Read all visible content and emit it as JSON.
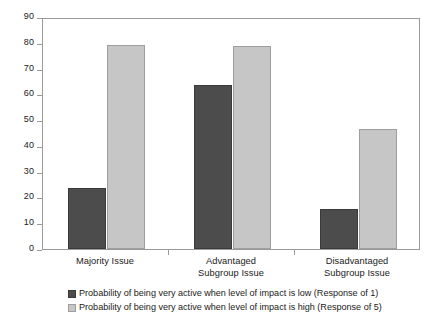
{
  "chart_data": {
    "type": "bar",
    "title": "",
    "subtitle": "",
    "xlabel": "",
    "ylabel": "",
    "ylim": [
      0,
      90
    ],
    "ytick_step": 10,
    "yticks": [
      "0",
      "10",
      "20",
      "30",
      "40",
      "50",
      "60",
      "70",
      "80",
      "90"
    ],
    "grid": false,
    "legend_position": "bottom",
    "categories": [
      "Majority Issue",
      "Advantaged\nSubgroup Issue",
      "Disadvantaged\nSubgroup Issue"
    ],
    "series": [
      {
        "name": "Probability of being very active when level of impact is low (Response of 1)",
        "key": "low",
        "color": "#4c4c4c",
        "values": [
          23.5,
          63.5,
          15.5
        ]
      },
      {
        "name": "Probability of being very active when level of impact is high (Response of 5)",
        "key": "high",
        "color": "#c6c6c6",
        "values": [
          79.0,
          78.8,
          46.5
        ]
      }
    ]
  },
  "legend": {
    "items": [
      {
        "swatch": "dark-gray-square",
        "label": "Probability of being very active when level of impact is low (Response of 1)"
      },
      {
        "swatch": "light-gray-square",
        "label": "Probability of being very active when level of impact is high (Response of 5)"
      }
    ]
  },
  "axis": {
    "y_tick_labels": [
      "90",
      "80",
      "70",
      "60",
      "50",
      "40",
      "30",
      "20",
      "10",
      "0"
    ],
    "x_tick_labels": [
      "Majority Issue",
      "Advantaged\nSubgroup Issue",
      "Disadvantaged\nSubgroup Issue"
    ]
  },
  "colors": {
    "series_low": "#4c4c4c",
    "series_high": "#c6c6c6",
    "frame": "#9a9a9a",
    "text": "#1b1b1b",
    "background": "#ffffff"
  }
}
